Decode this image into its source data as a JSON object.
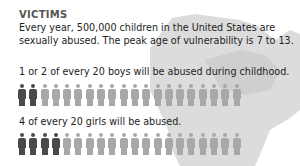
{
  "title": "VICTIMS",
  "intro": "Every year, 500,000 children in the United States are sexually abused. The peak age of vulnerability is 7 to 13.",
  "boys": {
    "statement": "1 or 2 of every 20 boys will be abused during childhood.",
    "total": 20,
    "highlighted": 2
  },
  "girls": {
    "statement": "4 of every 20 girls will be abused.",
    "total": 20,
    "highlighted": 4
  },
  "colors": {
    "highlight": "#4a4a4a",
    "normal": "#a8a8a8",
    "map": "#d9d9d9"
  }
}
